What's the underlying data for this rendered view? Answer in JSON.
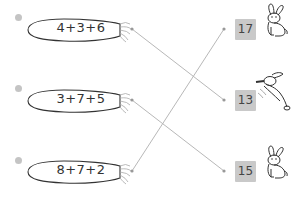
{
  "exercise": {
    "problems": [
      {
        "index": 1,
        "expression": "4+3+6",
        "answer": 13
      },
      {
        "index": 2,
        "expression": "3+7+5",
        "answer": 15
      },
      {
        "index": 3,
        "expression": "8+7+2",
        "answer": 17
      }
    ],
    "answers": [
      {
        "value": "17",
        "bunny": "sitting-bunny"
      },
      {
        "value": "13",
        "bunny": "leaping-bunny"
      },
      {
        "value": "15",
        "bunny": "sitting-bunny"
      }
    ],
    "connections": [
      {
        "from": "4+3+6",
        "to": "13"
      },
      {
        "from": "3+7+5",
        "to": "15"
      },
      {
        "from": "8+7+2",
        "to": "17"
      }
    ],
    "colors": {
      "line": "#b5b5b5",
      "answer_box": "#c9c9c9",
      "outline": "#333333"
    }
  }
}
